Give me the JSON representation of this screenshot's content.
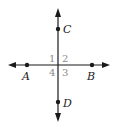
{
  "diagram": {
    "colors": {
      "line": "#1a1a1a",
      "point_label": "#222222",
      "angle_label": "#8a8a8a"
    },
    "lines": [
      {
        "name": "line-AB",
        "through": [
          "A",
          "B"
        ],
        "orientation": "horizontal",
        "arrows": "both"
      },
      {
        "name": "line-CD",
        "through": [
          "C",
          "D"
        ],
        "orientation": "vertical",
        "arrows": "both"
      }
    ],
    "points": [
      {
        "id": "A",
        "label": "A"
      },
      {
        "id": "B",
        "label": "B"
      },
      {
        "id": "C",
        "label": "C"
      },
      {
        "id": "D",
        "label": "D"
      }
    ],
    "angles": [
      {
        "id": "1",
        "label": "1",
        "quadrant": "upper-left"
      },
      {
        "id": "2",
        "label": "2",
        "quadrant": "upper-right"
      },
      {
        "id": "3",
        "label": "3",
        "quadrant": "lower-right"
      },
      {
        "id": "4",
        "label": "4",
        "quadrant": "lower-left"
      }
    ]
  }
}
